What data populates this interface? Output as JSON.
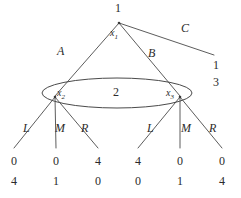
{
  "diagram": {
    "line_color": "#4a4a4a",
    "text_color": "#2b2b2b",
    "background": "#ffffff"
  },
  "players": {
    "root_player": "1",
    "infoset_player": "2"
  },
  "nodes": {
    "root": {
      "id": "x1",
      "label": "x",
      "sub": "1",
      "player": "1",
      "x": 119,
      "y": 22
    },
    "left": {
      "id": "x2",
      "label": "x",
      "sub": "2",
      "x": 55,
      "y": 97
    },
    "right": {
      "id": "x3",
      "label": "x",
      "sub": "3",
      "x": 180,
      "y": 97
    }
  },
  "information_set": {
    "player_label": "2",
    "center_x": 117,
    "center_y": 93,
    "rx": 75,
    "ry": 15
  },
  "actions": {
    "root": [
      {
        "label": "A",
        "from": "x1",
        "to": "x2",
        "lx": 57,
        "ly": 45
      },
      {
        "label": "B",
        "from": "x1",
        "to": "x3",
        "lx": 148,
        "ly": 47
      },
      {
        "label": "C",
        "from": "x1",
        "to": "t_C",
        "lx": 181,
        "ly": 22
      }
    ],
    "left_node": [
      {
        "label": "L",
        "lx": 23,
        "ly": 122
      },
      {
        "label": "M",
        "lx": 57,
        "ly": 122
      },
      {
        "label": "R",
        "lx": 82,
        "ly": 122
      }
    ],
    "right_node": [
      {
        "label": "L",
        "lx": 148,
        "ly": 122
      },
      {
        "label": "M",
        "lx": 183,
        "ly": 122
      },
      {
        "label": "R",
        "lx": 210,
        "ly": 122
      }
    ]
  },
  "terminals": [
    {
      "id": "t_C",
      "p1": "1",
      "p2": "3",
      "x": 216,
      "y": 62,
      "tx": 213,
      "ty": 60
    },
    {
      "id": "t_2L",
      "p1": "0",
      "p2": "4",
      "x": 14,
      "y": 155,
      "tx": 10,
      "ty": 155
    },
    {
      "id": "t_2M",
      "p1": "0",
      "p2": "1",
      "x": 56,
      "y": 155,
      "tx": 52,
      "ty": 155
    },
    {
      "id": "t_2R",
      "p1": "4",
      "p2": "0",
      "x": 98,
      "y": 155,
      "tx": 94,
      "ty": 155
    },
    {
      "id": "t_3L",
      "p1": "4",
      "p2": "0",
      "x": 138,
      "y": 155,
      "tx": 134,
      "ty": 155
    },
    {
      "id": "t_3M",
      "p1": "0",
      "p2": "1",
      "x": 180,
      "y": 155,
      "tx": 176,
      "ty": 155
    },
    {
      "id": "t_3R",
      "p1": "0",
      "p2": "4",
      "x": 222,
      "y": 155,
      "tx": 218,
      "ty": 155
    }
  ]
}
